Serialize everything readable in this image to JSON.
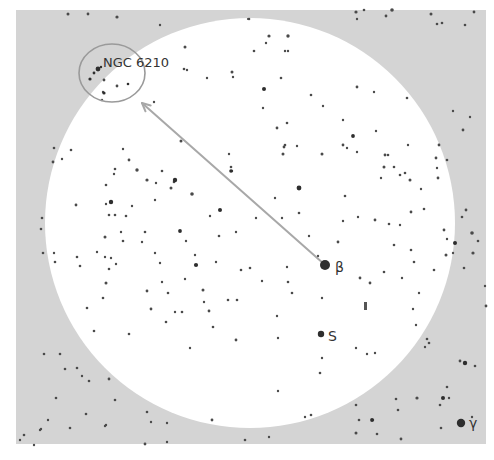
{
  "chart_data": {
    "type": "star_chart",
    "title": "",
    "panel": {
      "x": 16,
      "y": 10,
      "width": 470,
      "height": 434,
      "color": "#d4d4d4"
    },
    "field_of_view": {
      "cx": 250,
      "cy": 223,
      "r": 205,
      "color": "#ffffff"
    },
    "target": {
      "label": "NGC 6210",
      "circle": {
        "cx": 112,
        "cy": 73,
        "rx": 33,
        "ry": 29
      },
      "label_pos": {
        "x": 103,
        "y": 67
      },
      "marker": {
        "x": 98,
        "y": 69
      }
    },
    "pointer_arrow": {
      "from": {
        "x": 324,
        "y": 264
      },
      "to": {
        "x": 142,
        "y": 103
      },
      "color": "#a8a8a8"
    },
    "named_stars": [
      {
        "label": "β",
        "x": 325,
        "y": 265,
        "r": 5,
        "label_x": 335,
        "label_y": 272
      },
      {
        "label": "S",
        "x": 321,
        "y": 334,
        "r": 3.2,
        "label_x": 328,
        "label_y": 341
      },
      {
        "label": "γ",
        "x": 461,
        "y": 423,
        "r": 4.2,
        "label_x": 469,
        "label_y": 428
      }
    ],
    "colors": {
      "star": "#2e2e2e",
      "label": "#333333",
      "target_circle": "#9a9a9a"
    }
  },
  "stars": [
    [
      68,
      14,
      1.5
    ],
    [
      88,
      14,
      1.4
    ],
    [
      117,
      17,
      1.6
    ],
    [
      160,
      25,
      1.2
    ],
    [
      249,
      19,
      1.3
    ],
    [
      356,
      12,
      1.6
    ],
    [
      364,
      10,
      1.3
    ],
    [
      386,
      16,
      1.4
    ],
    [
      392,
      10,
      1.8
    ],
    [
      357,
      19,
      1.2
    ],
    [
      437,
      24,
      1.3
    ],
    [
      465,
      25,
      1.3
    ],
    [
      248,
      19,
      1.1
    ],
    [
      269,
      36,
      1.6
    ],
    [
      266,
      43,
      1.2
    ],
    [
      288,
      36,
      1.7
    ],
    [
      254,
      51,
      1.3
    ],
    [
      288,
      51,
      1.2
    ],
    [
      285,
      51,
      1.2
    ],
    [
      185,
      47,
      1.5
    ],
    [
      184,
      69,
      1.3
    ],
    [
      187,
      70,
      1.2
    ],
    [
      207,
      78,
      1.2
    ],
    [
      232,
      72,
      1.5
    ],
    [
      233,
      77,
      1.2
    ],
    [
      281,
      78,
      1.3
    ],
    [
      311,
      95,
      1.3
    ],
    [
      357,
      87,
      1.4
    ],
    [
      374,
      92,
      1.2
    ],
    [
      407,
      98,
      1.3
    ],
    [
      431,
      14,
      1.5
    ],
    [
      474,
      12,
      1.4
    ],
    [
      442,
      23,
      1.3
    ],
    [
      102,
      100,
      1.2
    ],
    [
      103,
      92,
      1.2
    ],
    [
      117,
      86,
      1.4
    ],
    [
      104,
      80,
      1.4
    ],
    [
      154,
      102,
      1.2
    ],
    [
      181,
      141,
      1.5
    ],
    [
      263,
      108,
      1.2
    ],
    [
      277,
      128,
      1.4
    ],
    [
      287,
      123,
      1.3
    ],
    [
      284,
      147,
      1.4
    ],
    [
      283,
      154,
      1.5
    ],
    [
      285,
      145,
      1.3
    ],
    [
      297,
      146,
      1.2
    ],
    [
      323,
      106,
      1.2
    ],
    [
      322,
      154,
      1.5
    ],
    [
      343,
      120,
      1.2
    ],
    [
      376,
      131,
      1.2
    ],
    [
      384,
      167,
      1.5
    ],
    [
      385,
      155,
      1.4
    ],
    [
      405,
      173,
      1.3
    ],
    [
      394,
      167,
      1.3
    ],
    [
      408,
      145,
      1.2
    ],
    [
      439,
      145,
      1.4
    ],
    [
      463,
      130,
      1.4
    ],
    [
      453,
      111,
      1.2
    ],
    [
      470,
      117,
      1.2
    ],
    [
      54,
      148,
      1.3
    ],
    [
      53,
      162,
      1.4
    ],
    [
      123,
      149,
      1.2
    ],
    [
      115,
      169,
      1.3
    ],
    [
      114,
      174,
      1.2
    ],
    [
      137,
      170,
      1.7
    ],
    [
      129,
      160,
      1.4
    ],
    [
      162,
      171,
      1.3
    ],
    [
      147,
      180,
      1.6
    ],
    [
      111,
      202,
      1.6
    ],
    [
      106,
      204,
      1.2
    ],
    [
      156,
      183,
      1.2
    ],
    [
      171,
      188,
      1.5
    ],
    [
      192,
      194,
      1.8
    ],
    [
      155,
      200,
      1.2
    ],
    [
      109,
      215,
      1.3
    ],
    [
      123,
      241,
      1.3
    ],
    [
      106,
      283,
      1.5
    ],
    [
      105,
      237,
      1.5
    ],
    [
      126,
      216,
      1.3
    ],
    [
      132,
      206,
      1.2
    ],
    [
      145,
      232,
      1.3
    ],
    [
      105,
      257,
      1.2
    ],
    [
      121,
      232,
      1.2
    ],
    [
      142,
      242,
      1.2
    ],
    [
      186,
      241,
      1.2
    ],
    [
      155,
      253,
      1.2
    ],
    [
      160,
      263,
      1.2
    ],
    [
      162,
      282,
      1.2
    ],
    [
      174,
      182,
      1.3
    ],
    [
      42,
      218,
      1.3
    ],
    [
      41,
      229,
      1.3
    ],
    [
      43,
      253,
      1.3
    ],
    [
      54,
      253,
      1.2
    ],
    [
      55,
      262,
      1.3
    ],
    [
      77,
      257,
      1.3
    ],
    [
      80,
      266,
      1.3
    ],
    [
      109,
      269,
      1.3
    ],
    [
      111,
      258,
      1.2
    ],
    [
      116,
      264,
      1.2
    ],
    [
      87,
      308,
      1.3
    ],
    [
      97,
      252,
      1.2
    ],
    [
      115,
      215,
      1.3
    ],
    [
      76,
      205,
      1.4
    ],
    [
      106,
      185,
      1.3
    ],
    [
      71,
      150,
      1.3
    ],
    [
      62,
      159,
      1.2
    ],
    [
      343,
      145,
      1.4
    ],
    [
      347,
      148,
      1.2
    ],
    [
      357,
      152,
      1.2
    ],
    [
      388,
      155,
      1.3
    ],
    [
      381,
      178,
      1.2
    ],
    [
      400,
      175,
      1.3
    ],
    [
      410,
      180,
      1.5
    ],
    [
      411,
      212,
      1.4
    ],
    [
      421,
      189,
      1.2
    ],
    [
      424,
      209,
      1.3
    ],
    [
      436,
      158,
      1.4
    ],
    [
      437,
      168,
      1.2
    ],
    [
      438,
      178,
      1.4
    ],
    [
      447,
      160,
      1.3
    ],
    [
      466,
      210,
      1.4
    ],
    [
      472,
      233,
      1.8
    ],
    [
      444,
      230,
      1.4
    ],
    [
      446,
      255,
      1.5
    ],
    [
      453,
      253,
      1.2
    ],
    [
      447,
      239,
      1.2
    ],
    [
      462,
      217,
      1.3
    ],
    [
      478,
      241,
      1.3
    ],
    [
      473,
      253,
      1.6
    ],
    [
      275,
      198,
      1.2
    ],
    [
      309,
      236,
      1.2
    ],
    [
      299,
      213,
      1.3
    ],
    [
      282,
      218,
      1.2
    ],
    [
      345,
      196,
      1.3
    ],
    [
      343,
      221,
      1.2
    ],
    [
      358,
      217,
      1.2
    ],
    [
      375,
      220,
      1.4
    ],
    [
      389,
      224,
      1.3
    ],
    [
      394,
      245,
      1.3
    ],
    [
      411,
      250,
      1.3
    ],
    [
      384,
      272,
      1.3
    ],
    [
      414,
      262,
      1.3
    ],
    [
      400,
      225,
      1.2
    ],
    [
      338,
      242,
      1.4
    ],
    [
      318,
      256,
      1.2
    ],
    [
      250,
      268,
      1.3
    ],
    [
      287,
      267,
      1.2
    ],
    [
      262,
      281,
      1.2
    ],
    [
      288,
      282,
      1.3
    ],
    [
      292,
      293,
      1.3
    ],
    [
      277,
      316,
      1.2
    ],
    [
      278,
      338,
      1.2
    ],
    [
      322,
      298,
      1.2
    ],
    [
      360,
      278,
      1.4
    ],
    [
      370,
      283,
      1.4
    ],
    [
      402,
      278,
      1.2
    ],
    [
      413,
      309,
      1.2
    ],
    [
      419,
      293,
      1.2
    ],
    [
      416,
      325,
      1.2
    ],
    [
      429,
      343,
      1.3
    ],
    [
      425,
      347,
      1.2
    ],
    [
      427,
      339,
      1.3
    ],
    [
      356,
      348,
      1.2
    ],
    [
      367,
      354,
      1.2
    ],
    [
      375,
      353,
      1.2
    ],
    [
      322,
      358,
      1.2
    ],
    [
      320,
      373,
      1.3
    ],
    [
      278,
      391,
      1.2
    ],
    [
      311,
      415,
      1.3
    ],
    [
      305,
      417,
      1.2
    ],
    [
      356,
      405,
      1.3
    ],
    [
      359,
      420,
      1.3
    ],
    [
      373,
      420,
      1.2
    ],
    [
      396,
      399,
      1.3
    ],
    [
      398,
      410,
      1.3
    ],
    [
      417,
      398,
      1.6
    ],
    [
      447,
      387,
      1.3
    ],
    [
      460,
      361,
      1.4
    ],
    [
      475,
      366,
      1.3
    ],
    [
      485,
      286,
      1.2
    ],
    [
      434,
      270,
      1.3
    ],
    [
      464,
      268,
      1.3
    ],
    [
      486,
      306,
      1.4
    ],
    [
      203,
      290,
      1.5
    ],
    [
      209,
      311,
      1.4
    ],
    [
      151,
      309,
      1.4
    ],
    [
      147,
      291,
      1.4
    ],
    [
      103,
      298,
      1.3
    ],
    [
      129,
      334,
      1.3
    ],
    [
      166,
      322,
      1.3
    ],
    [
      175,
      312,
      1.2
    ],
    [
      182,
      312,
      1.3
    ],
    [
      168,
      293,
      1.3
    ],
    [
      185,
      279,
      1.2
    ],
    [
      94,
      331,
      1.3
    ],
    [
      190,
      348,
      1.2
    ],
    [
      213,
      327,
      1.3
    ],
    [
      236,
      340,
      1.4
    ],
    [
      216,
      262,
      1.2
    ],
    [
      228,
      300,
      1.3
    ],
    [
      237,
      300,
      1.3
    ],
    [
      204,
      302,
      1.2
    ],
    [
      241,
      270,
      1.3
    ],
    [
      210,
      216,
      1.2
    ],
    [
      219,
      236,
      1.3
    ],
    [
      236,
      232,
      1.2
    ],
    [
      231,
      167,
      1.3
    ],
    [
      232,
      171,
      1.2
    ],
    [
      229,
      154,
      1.2
    ],
    [
      195,
      255,
      1.2
    ],
    [
      256,
      218,
      1.2
    ],
    [
      60,
      354,
      1.3
    ],
    [
      44,
      354,
      1.3
    ],
    [
      65,
      369,
      1.3
    ],
    [
      56,
      398,
      1.3
    ],
    [
      77,
      368,
      1.3
    ],
    [
      82,
      376,
      1.2
    ],
    [
      109,
      379,
      1.4
    ],
    [
      89,
      381,
      1.3
    ],
    [
      86,
      414,
      1.3
    ],
    [
      106,
      425,
      1.2
    ],
    [
      115,
      400,
      1.3
    ],
    [
      147,
      412,
      1.3
    ],
    [
      151,
      422,
      1.2
    ],
    [
      167,
      423,
      1.2
    ],
    [
      145,
      444,
      1.4
    ],
    [
      167,
      442,
      1.2
    ],
    [
      245,
      440,
      1.3
    ],
    [
      269,
      437,
      1.2
    ],
    [
      356,
      433,
      1.5
    ],
    [
      377,
      434,
      1.3
    ],
    [
      401,
      439,
      1.4
    ],
    [
      441,
      428,
      1.3
    ],
    [
      449,
      398,
      1.2
    ],
    [
      440,
      405,
      1.3
    ],
    [
      472,
      417,
      1.2
    ],
    [
      40,
      430,
      1.2
    ],
    [
      105,
      426,
      1.2
    ],
    [
      212,
      420,
      1.4
    ],
    [
      41,
      429,
      1.2
    ],
    [
      20,
      440,
      1.2
    ],
    [
      24,
      435,
      1.3
    ],
    [
      34,
      445,
      1.2
    ],
    [
      48,
      420,
      1.2
    ],
    [
      70,
      428,
      1.3
    ]
  ],
  "bright_stars": [
    [
      175,
      180,
      2.2
    ],
    [
      220,
      210,
      2.0
    ],
    [
      180,
      231,
      1.9
    ],
    [
      196,
      265,
      2.1
    ],
    [
      231,
      171,
      1.8
    ],
    [
      264,
      89,
      2.0
    ],
    [
      111,
      202,
      2.2
    ],
    [
      299,
      188,
      2.4
    ],
    [
      353,
      136,
      1.9
    ],
    [
      465,
      363,
      2.2
    ],
    [
      455,
      243,
      2.0
    ],
    [
      443,
      398,
      2.0
    ],
    [
      372,
      420,
      1.9
    ]
  ]
}
